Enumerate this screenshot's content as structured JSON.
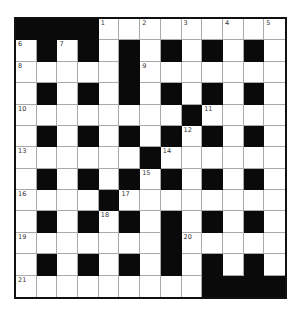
{
  "puzzle": {
    "rows": 13,
    "cols": 13,
    "colors": {
      "block": "#0a0a0a",
      "empty": "#ffffff",
      "gridline": "#a9a9a9",
      "border": "#111111"
    },
    "grid": [
      "####.........",
      ".#.#.#.#.#.#.",
      ".....#.......",
      ".#.#.#.#.#.#.",
      "........#....",
      ".#.#.#.#.#.#.",
      "......#......",
      ".#.#.#.#.#.#.",
      "....#........",
      ".#.#.#.#.#.#.",
      ".......#.....",
      ".#.#.#.#.#.#.",
      ".........####"
    ],
    "numbers": [
      {
        "n": "1",
        "r": 0,
        "c": 4
      },
      {
        "n": "2",
        "r": 0,
        "c": 6
      },
      {
        "n": "3",
        "r": 0,
        "c": 8
      },
      {
        "n": "4",
        "r": 0,
        "c": 10
      },
      {
        "n": "5",
        "r": 0,
        "c": 12
      },
      {
        "n": "6",
        "r": 1,
        "c": 0
      },
      {
        "n": "7",
        "r": 1,
        "c": 2
      },
      {
        "n": "8",
        "r": 2,
        "c": 0
      },
      {
        "n": "9",
        "r": 2,
        "c": 6
      },
      {
        "n": "10",
        "r": 4,
        "c": 0
      },
      {
        "n": "11",
        "r": 4,
        "c": 9
      },
      {
        "n": "12",
        "r": 5,
        "c": 8
      },
      {
        "n": "13",
        "r": 6,
        "c": 0
      },
      {
        "n": "14",
        "r": 6,
        "c": 7
      },
      {
        "n": "15",
        "r": 7,
        "c": 6
      },
      {
        "n": "16",
        "r": 8,
        "c": 0
      },
      {
        "n": "17",
        "r": 8,
        "c": 5
      },
      {
        "n": "18",
        "r": 9,
        "c": 4
      },
      {
        "n": "19",
        "r": 10,
        "c": 0
      },
      {
        "n": "20",
        "r": 10,
        "c": 8
      },
      {
        "n": "21",
        "r": 12,
        "c": 0
      }
    ]
  }
}
